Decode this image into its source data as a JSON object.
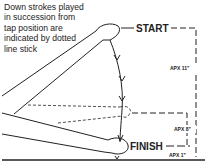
{
  "caption": {
    "lines": [
      "Down strokes played",
      "in succession from",
      "tap position are",
      "indicated by dotted",
      "line stick"
    ]
  },
  "labels": {
    "start": "START",
    "finish": "FINISH",
    "dim_top": "APX 11\"",
    "dim_mid": "APX 8\"",
    "dim_bottom": "APX 1\""
  },
  "colors": {
    "ink": "#222222",
    "background": "#ffffff"
  }
}
